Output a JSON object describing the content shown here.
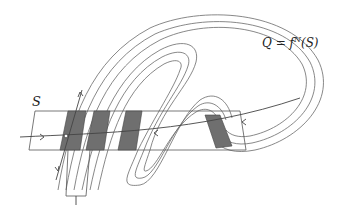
{
  "diagram": {
    "labels": {
      "S": "S",
      "Q": "Q = f",
      "Q_sup": "N",
      "Q_tail": "(S)"
    },
    "colors": {
      "stroke": "#6a6a6a",
      "shaded_strip": "#6f6f6f",
      "background": "#ffffff"
    }
  }
}
